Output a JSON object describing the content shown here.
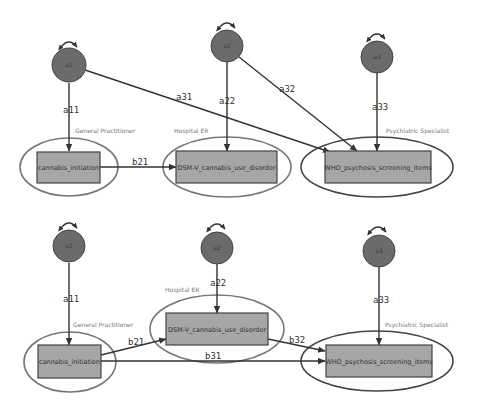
{
  "colors": {
    "latent_fill": "#6b6b6b",
    "box_fill": "#a6a6a6",
    "edge": "#333333",
    "group_label": "#777777"
  },
  "top_model": {
    "latents": [
      {
        "id": "a1",
        "label": "a1"
      },
      {
        "id": "a2",
        "label": "a2"
      },
      {
        "id": "a3",
        "label": "a3"
      }
    ],
    "observed": [
      {
        "id": "cannabis",
        "label": "cannabis_initiation"
      },
      {
        "id": "dsm",
        "label": "DSM-V_cannabis_use_disorder"
      },
      {
        "id": "who",
        "label": "WHO_psychosis_screening_items"
      }
    ],
    "groups": [
      {
        "label": "General Practitioner"
      },
      {
        "label": "Hospital ER"
      },
      {
        "label": "Psychiatric Specialist"
      }
    ],
    "paths": [
      {
        "label": "a11",
        "from": "a1",
        "to": "cannabis_initiation"
      },
      {
        "label": "a31",
        "from": "a1",
        "to": "WHO_psychosis_screening_items"
      },
      {
        "label": "a22",
        "from": "a2",
        "to": "DSM-V_cannabis_use_disorder"
      },
      {
        "label": "a32",
        "from": "a2",
        "to": "WHO_psychosis_screening_items"
      },
      {
        "label": "a33",
        "from": "a3",
        "to": "WHO_psychosis_screening_items"
      },
      {
        "label": "b21",
        "from": "cannabis_initiation",
        "to": "DSM-V_cannabis_use_disorder"
      }
    ]
  },
  "bottom_model": {
    "latents": [
      {
        "id": "a1",
        "label": "a1"
      },
      {
        "id": "a2",
        "label": "a2"
      },
      {
        "id": "a3",
        "label": "a3"
      }
    ],
    "observed": [
      {
        "id": "cannabis",
        "label": "cannabis_initiation"
      },
      {
        "id": "dsm",
        "label": "DSM-V_cannabis_use_disorder"
      },
      {
        "id": "who",
        "label": "WHO_psychosis_screening_items"
      }
    ],
    "groups": [
      {
        "label": "General Practitioner"
      },
      {
        "label": "Hospital ER"
      },
      {
        "label": "Psychiatric Specialist"
      }
    ],
    "paths": [
      {
        "label": "a11",
        "from": "a1",
        "to": "cannabis_initiation"
      },
      {
        "label": "a22",
        "from": "a2",
        "to": "DSM-V_cannabis_use_disorder"
      },
      {
        "label": "a33",
        "from": "a3",
        "to": "WHO_psychosis_screening_items"
      },
      {
        "label": "b21",
        "from": "cannabis_initiation",
        "to": "DSM-V_cannabis_use_disorder"
      },
      {
        "label": "b31",
        "from": "cannabis_initiation",
        "to": "WHO_psychosis_screening_items"
      },
      {
        "label": "b32",
        "from": "DSM-V_cannabis_use_disorder",
        "to": "WHO_psychosis_screening_items"
      }
    ]
  }
}
